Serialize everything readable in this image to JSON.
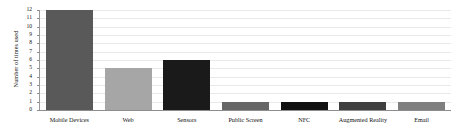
{
  "chart_data": {
    "type": "bar",
    "title": "",
    "xlabel": "",
    "ylabel": "Number of times used",
    "categories": [
      "Mobile Devices",
      "Web",
      "Sensors",
      "Public Screen",
      "NFC",
      "Augmented Reality",
      "Email"
    ],
    "values": [
      12,
      5,
      6,
      1,
      1,
      1,
      1
    ],
    "bar_colors": [
      "#595959",
      "#a6a6a6",
      "#1a1a1a",
      "#666666",
      "#111111",
      "#3f3f3f",
      "#7f7f7f"
    ],
    "ylim": [
      0,
      12
    ],
    "yticks": [
      0,
      1,
      2,
      3,
      4,
      5,
      6,
      7,
      8,
      9,
      10,
      11,
      12
    ],
    "ytick_labels": [
      "0",
      "1",
      "2",
      "3",
      "4",
      "5",
      "6",
      "7",
      "8",
      "9",
      "10",
      "11",
      "12"
    ],
    "grid": true,
    "grid_color": "#e9e9e9",
    "legend": false,
    "legend_position": "none",
    "background": "#ffffff",
    "axis_color": "#8d8d8d",
    "text_color": "#131313"
  }
}
